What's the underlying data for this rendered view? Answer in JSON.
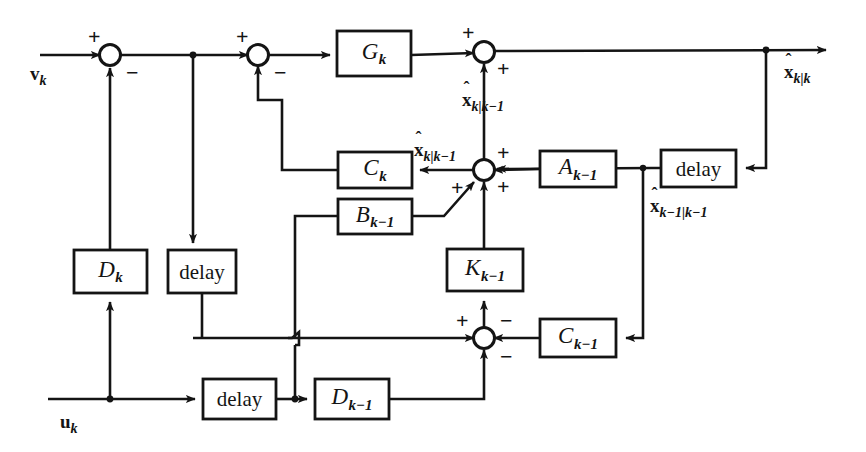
{
  "diagram": {
    "stroke_color": "#141414",
    "background_color": "#ffffff",
    "blocks": [
      {
        "id": "G_k",
        "label": "G",
        "sub": "k",
        "kind": "gain",
        "x": 337,
        "y": 31,
        "w": 74,
        "h": 45
      },
      {
        "id": "C_k",
        "label": "C",
        "sub": "k",
        "kind": "gain",
        "x": 338,
        "y": 152,
        "w": 74,
        "h": 36
      },
      {
        "id": "B_k-1",
        "label": "B",
        "sub": "k−1",
        "kind": "gain",
        "x": 338,
        "y": 199,
        "w": 74,
        "h": 35
      },
      {
        "id": "A_k-1",
        "label": "A",
        "sub": "k−1",
        "kind": "gain",
        "x": 540,
        "y": 151,
        "w": 76,
        "h": 36
      },
      {
        "id": "D_k",
        "label": "D",
        "sub": "k",
        "kind": "gain",
        "x": 74,
        "y": 250,
        "w": 73,
        "h": 43
      },
      {
        "id": "K_k-1",
        "label": "K",
        "sub": "k−1",
        "kind": "gain",
        "x": 447,
        "y": 249,
        "w": 76,
        "h": 42
      },
      {
        "id": "C_k-1",
        "label": "C",
        "sub": "k−1",
        "kind": "gain",
        "x": 540,
        "y": 319,
        "w": 76,
        "h": 38
      },
      {
        "id": "D_k-1",
        "label": "D",
        "sub": "k−1",
        "kind": "gain",
        "x": 315,
        "y": 379,
        "w": 74,
        "h": 40
      },
      {
        "id": "delay_top_right",
        "label": "delay",
        "sub": "",
        "kind": "delay",
        "x": 661,
        "y": 150,
        "w": 75,
        "h": 37
      },
      {
        "id": "delay_mid_left",
        "label": "delay",
        "sub": "",
        "kind": "delay",
        "x": 168,
        "y": 250,
        "w": 68,
        "h": 43
      },
      {
        "id": "delay_bottom",
        "label": "delay",
        "sub": "",
        "kind": "delay",
        "x": 203,
        "y": 379,
        "w": 73,
        "h": 40
      }
    ],
    "summing_junctions": [
      {
        "id": "sum1",
        "cx": 110,
        "cy": 55,
        "signs": [
          {
            "text": "+",
            "x": 88,
            "y": 26
          },
          {
            "text": "−",
            "x": 126,
            "y": 62
          }
        ]
      },
      {
        "id": "sum2",
        "cx": 258,
        "cy": 55,
        "signs": [
          {
            "text": "+",
            "x": 236,
            "y": 26
          },
          {
            "text": "−",
            "x": 274,
            "y": 62
          }
        ]
      },
      {
        "id": "sum3",
        "cx": 484,
        "cy": 52,
        "signs": [
          {
            "text": "+",
            "x": 462,
            "y": 22
          },
          {
            "text": "+",
            "x": 497,
            "y": 58
          }
        ]
      },
      {
        "id": "sum4",
        "cx": 484,
        "cy": 170,
        "signs": [
          {
            "text": "+",
            "x": 497,
            "y": 142
          },
          {
            "text": "+",
            "x": 497,
            "y": 176
          },
          {
            "text": "+",
            "x": 451,
            "y": 177
          }
        ]
      },
      {
        "id": "sum5",
        "cx": 484,
        "cy": 338,
        "signs": [
          {
            "text": "+",
            "x": 456,
            "y": 310
          },
          {
            "text": "−",
            "x": 500,
            "y": 310
          },
          {
            "text": "−",
            "x": 500,
            "y": 346
          }
        ]
      }
    ],
    "signal_labels": [
      {
        "id": "v_k",
        "base": "v",
        "sub": "k",
        "hat": false,
        "x": 30,
        "y": 64
      },
      {
        "id": "u_k",
        "base": "u",
        "sub": "k",
        "hat": false,
        "x": 60,
        "y": 412
      },
      {
        "id": "x_k|k",
        "base": "x",
        "sub": "k|k",
        "hat": true,
        "x": 784,
        "y": 62
      },
      {
        "id": "x_k|k-1_a",
        "base": "x",
        "sub": "k|k−1",
        "hat": true,
        "x": 462,
        "y": 90
      },
      {
        "id": "x_k|k-1_b",
        "base": "x",
        "sub": "k|k−1",
        "hat": true,
        "x": 414,
        "y": 140
      },
      {
        "id": "x_k-1|k-1",
        "base": "x",
        "sub": "k−1|k−1",
        "hat": true,
        "x": 650,
        "y": 196
      }
    ]
  }
}
